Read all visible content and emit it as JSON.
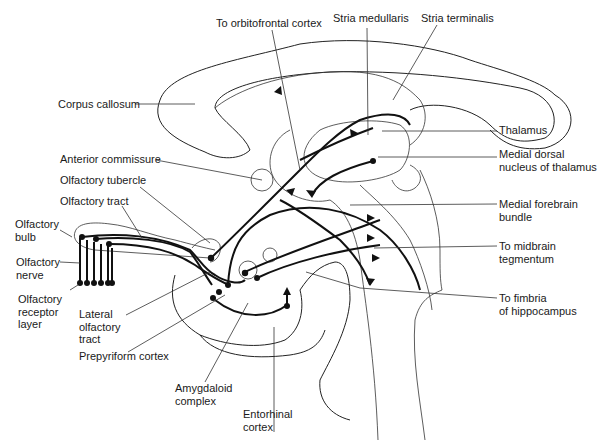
{
  "diagram": {
    "labels": {
      "to_orbitofrontal_cortex": "To orbitofrontal cortex",
      "stria_medullaris": "Stria medullaris",
      "stria_terminalis": "Stria terminalis",
      "corpus_callosum": "Corpus callosum",
      "thalamus": "Thalamus",
      "anterior_commissure": "Anterior commissure",
      "medial_dorsal_nucleus_line1": "Medial dorsal",
      "medial_dorsal_nucleus_line2": "nucleus of thalamus",
      "olfactory_tubercle": "Olfactory tubercle",
      "olfactory_tract": "Olfactory tract",
      "medial_forebrain_bundle_line1": "Medial forebrain",
      "medial_forebrain_bundle_line2": "bundle",
      "olfactory_bulb_line1": "Olfactory",
      "olfactory_bulb_line2": "bulb",
      "to_midbrain_tegmentum_line1": "To midbrain",
      "to_midbrain_tegmentum_line2": "tegmentum",
      "olfactory_nerve_line1": "Olfactory",
      "olfactory_nerve_line2": "nerve",
      "olfactory_receptor_layer_line1": "Olfactory",
      "olfactory_receptor_layer_line2": "receptor",
      "olfactory_receptor_layer_line3": "layer",
      "lateral_olfactory_tract_line1": "Lateral",
      "lateral_olfactory_tract_line2": "olfactory",
      "lateral_olfactory_tract_line3": "tract",
      "to_fimbria_line1": "To fimbria",
      "to_fimbria_line2": "of hippocampus",
      "prepyriform_cortex": "Prepyriform cortex",
      "amygdaloid_complex_line1": "Amygdaloid",
      "amygdaloid_complex_line2": "complex",
      "entorhinal_cortex_line1": "Entorhinal",
      "entorhinal_cortex_line2": "cortex"
    }
  }
}
